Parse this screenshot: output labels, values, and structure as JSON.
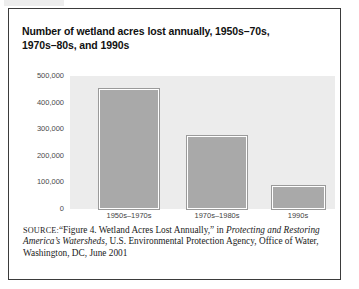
{
  "figure": {
    "title_line1": "Number of wetland acres lost annually, 1950s–70s,",
    "title_line2": "1970s–80s, and 1990s",
    "source": {
      "label": "SOURCE:",
      "text_part1": "“Figure 4. Wetland Acres Lost Annually,” in ",
      "italic_part1": "Protecting and Restoring America’s Watersheds",
      "text_part2": ", U.S. Environmental Protection Agency, Office of Water, Washington, DC, June 2001"
    }
  },
  "colors": {
    "bar_fill": "#a9a9a9",
    "plot_background": "#ececec",
    "frame_border": "#3b3b3b",
    "title_text": "#111111",
    "tick_text": "#4a4a4a"
  },
  "chart_data": {
    "type": "bar",
    "title": "Number of wetland acres lost annually, 1950s–70s, 1970s–80s, and 1990s",
    "xlabel": "",
    "ylabel": "",
    "categories": [
      "1950s–1970s",
      "1970s–1980s",
      "1990s"
    ],
    "values": [
      450000,
      275000,
      85000
    ],
    "ylim": [
      0,
      500000
    ],
    "yticks": [
      0,
      100000,
      200000,
      300000,
      400000,
      500000
    ],
    "ytick_labels": [
      "0",
      "100,000",
      "200,000",
      "300,000",
      "400,000",
      "500,000"
    ],
    "grid": false,
    "legend": null,
    "series": [
      {
        "name": "Wetland acres lost annually",
        "values": [
          450000,
          275000,
          85000
        ]
      }
    ]
  }
}
